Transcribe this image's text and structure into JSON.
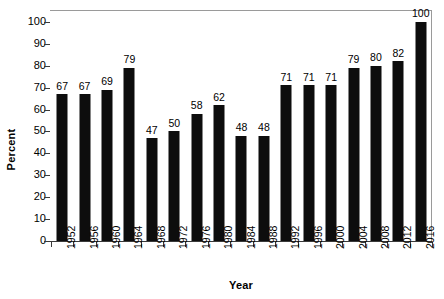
{
  "chart_data": {
    "type": "bar",
    "title": "",
    "subtitle": "",
    "xlabel": "Year",
    "ylabel": "Percent",
    "categories": [
      "1952",
      "1956",
      "1960",
      "1964",
      "1968",
      "1972",
      "1976",
      "1980",
      "1984",
      "1988",
      "1992",
      "1996",
      "2000",
      "2004",
      "2008",
      "2012",
      "2016"
    ],
    "values": [
      67,
      67,
      69,
      79,
      47,
      50,
      58,
      62,
      48,
      48,
      71,
      71,
      71,
      79,
      80,
      82,
      100
    ],
    "data_labels": [
      "67",
      "67",
      "69",
      "79",
      "47",
      "50",
      "58",
      "62",
      "48",
      "48",
      "71",
      "71",
      "71",
      "79",
      "80",
      "82",
      "100"
    ],
    "ylim": [
      0,
      105
    ],
    "yticks": [
      0,
      10,
      20,
      30,
      40,
      50,
      60,
      70,
      80,
      90,
      100
    ],
    "ytick_labels": [
      "0",
      "10",
      "20",
      "30",
      "40",
      "50",
      "60",
      "70",
      "80",
      "90",
      "100"
    ],
    "grid": false,
    "legend": null,
    "legend_position": "none",
    "bar_color": "#0d0d0d",
    "axis_color": "#3a3a3a",
    "frame_color": "#9a9a9a",
    "background": "#ffffff",
    "xtick_rotation": 90,
    "annotations": []
  }
}
